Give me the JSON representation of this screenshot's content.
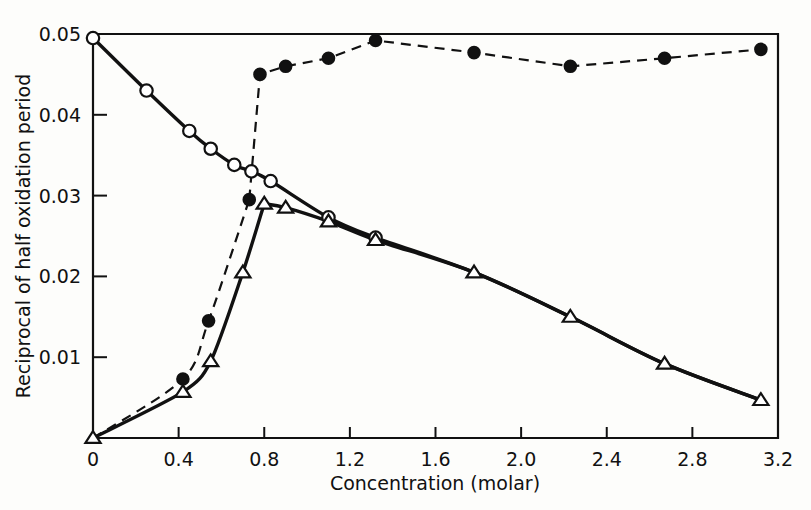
{
  "chart_data": {
    "type": "line",
    "title": "",
    "xlabel": "Concentration (molar)",
    "ylabel": "Reciprocal of half oxidation period",
    "xlim": [
      0,
      3.2
    ],
    "ylim": [
      0,
      0.05
    ],
    "grid": false,
    "legend": "none",
    "xticks": [
      0,
      0.4,
      0.8,
      1.2,
      1.6,
      2.0,
      2.4,
      2.8,
      3.2
    ],
    "xticklabels": [
      "0",
      "0.4",
      "0.8",
      "1.2",
      "1.6",
      "2.0",
      "2.4",
      "2.8",
      "3.2"
    ],
    "yticks": [
      0.01,
      0.02,
      0.03,
      0.04,
      0.05
    ],
    "yticklabels": [
      "0.01",
      "0.02",
      "0.03",
      "0.04",
      "0.05"
    ],
    "series": [
      {
        "name": "open-circle-descending",
        "marker": "open-circle",
        "linestyle": "solid",
        "points": [
          [
            0.0,
            0.0495
          ],
          [
            0.25,
            0.043
          ],
          [
            0.45,
            0.038
          ],
          [
            0.55,
            0.0358
          ],
          [
            0.66,
            0.0338
          ],
          [
            0.74,
            0.033
          ],
          [
            0.83,
            0.0318
          ],
          [
            1.1,
            0.0273
          ],
          [
            1.32,
            0.0248
          ]
        ]
      },
      {
        "name": "filled-circle-dashed",
        "marker": "filled-circle",
        "linestyle": "dashed",
        "points": [
          [
            0.0,
            0.0
          ],
          [
            0.42,
            0.0073
          ],
          [
            0.54,
            0.0145
          ],
          [
            0.73,
            0.0295
          ],
          [
            0.78,
            0.045
          ],
          [
            0.9,
            0.046
          ],
          [
            1.1,
            0.047
          ],
          [
            1.32,
            0.0492
          ],
          [
            1.78,
            0.0477
          ],
          [
            2.23,
            0.046
          ],
          [
            2.67,
            0.047
          ],
          [
            3.12,
            0.0481
          ]
        ]
      },
      {
        "name": "open-triangle-solid",
        "marker": "open-triangle",
        "linestyle": "solid",
        "points": [
          [
            0.0,
            0.0
          ],
          [
            0.42,
            0.0057
          ],
          [
            0.55,
            0.0095
          ],
          [
            0.7,
            0.0205
          ],
          [
            0.8,
            0.029
          ],
          [
            0.9,
            0.0285
          ],
          [
            1.1,
            0.0268
          ],
          [
            1.32,
            0.0245
          ],
          [
            1.78,
            0.0205
          ],
          [
            2.23,
            0.015
          ],
          [
            2.67,
            0.0092
          ],
          [
            3.12,
            0.0047
          ]
        ]
      }
    ]
  }
}
